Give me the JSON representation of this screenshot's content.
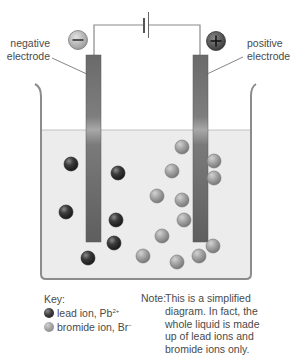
{
  "labels": {
    "negative_electrode_line1": "negative",
    "negative_electrode_line2": "electrode",
    "positive_electrode_line1": "positive",
    "positive_electrode_line2": "electrode",
    "negative_symbol": "−",
    "positive_symbol": "+"
  },
  "key": {
    "heading": "Key:",
    "lead_label": "lead ion, Pb",
    "lead_charge": "2+",
    "bromide_label": "bromide ion, Br",
    "bromide_charge": "−"
  },
  "note": {
    "heading": "Note:",
    "text": "This is a simplified diagram. In fact, the whole liquid is made up of lead ions and bromide ions only."
  },
  "colors": {
    "wire": "#8a8a8a",
    "electrode": "#6e6e6e",
    "liquid": "#eeeeee",
    "beaker": "#8c8c8c",
    "lead_ion": "#2e2e2e",
    "bromide_ion": "#a0a0a0"
  },
  "ions": {
    "lead": [
      {
        "x": 71,
        "y": 164
      },
      {
        "x": 118,
        "y": 173
      },
      {
        "x": 66,
        "y": 212
      },
      {
        "x": 116,
        "y": 220
      },
      {
        "x": 114,
        "y": 243
      },
      {
        "x": 88,
        "y": 258
      }
    ],
    "bromide": [
      {
        "x": 182,
        "y": 147
      },
      {
        "x": 172,
        "y": 171
      },
      {
        "x": 214,
        "y": 161
      },
      {
        "x": 214,
        "y": 178
      },
      {
        "x": 157,
        "y": 196
      },
      {
        "x": 182,
        "y": 200
      },
      {
        "x": 184,
        "y": 220
      },
      {
        "x": 162,
        "y": 236
      },
      {
        "x": 143,
        "y": 256
      },
      {
        "x": 177,
        "y": 262
      },
      {
        "x": 199,
        "y": 256
      },
      {
        "x": 213,
        "y": 246
      }
    ]
  }
}
